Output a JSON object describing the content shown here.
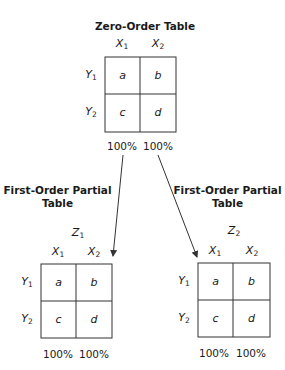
{
  "diagram": {
    "zero_order": {
      "title": "Zero-Order Table",
      "col_labels": [
        {
          "var": "X",
          "sub": "1"
        },
        {
          "var": "X",
          "sub": "2"
        }
      ],
      "row_labels": [
        {
          "var": "Y",
          "sub": "1"
        },
        {
          "var": "Y",
          "sub": "2"
        }
      ],
      "cells": [
        "a",
        "b",
        "c",
        "d"
      ],
      "percents": [
        "100%",
        "100%"
      ]
    },
    "partial_left": {
      "title_line1": "First-Order Partial",
      "title_line2": "Table",
      "control": {
        "var": "Z",
        "sub": "1"
      },
      "col_labels": [
        {
          "var": "X",
          "sub": "1"
        },
        {
          "var": "X",
          "sub": "2"
        }
      ],
      "row_labels": [
        {
          "var": "Y",
          "sub": "1"
        },
        {
          "var": "Y",
          "sub": "2"
        }
      ],
      "cells": [
        "a",
        "b",
        "c",
        "d"
      ],
      "percents": [
        "100%",
        "100%"
      ]
    },
    "partial_right": {
      "title_line1": "First-Order Partial",
      "title_line2": "Table",
      "control": {
        "var": "Z",
        "sub": "2"
      },
      "col_labels": [
        {
          "var": "X",
          "sub": "1"
        },
        {
          "var": "X",
          "sub": "2"
        }
      ],
      "row_labels": [
        {
          "var": "Y",
          "sub": "1"
        },
        {
          "var": "Y",
          "sub": "2"
        }
      ],
      "cells": [
        "a",
        "b",
        "c",
        "d"
      ],
      "percents": [
        "100%",
        "100%"
      ]
    },
    "colors": {
      "line": "#333333",
      "text": "#1a1a1a",
      "background": "#ffffff"
    }
  }
}
